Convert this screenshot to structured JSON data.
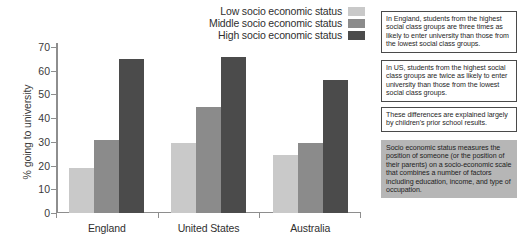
{
  "chart_data": {
    "type": "bar",
    "title": "",
    "xlabel": "",
    "ylabel": "% going to university",
    "ylim": [
      0,
      70
    ],
    "ytick_step": 10,
    "yticks": [
      "70",
      "60",
      "50",
      "40",
      "30",
      "20",
      "10",
      "0"
    ],
    "grid": false,
    "legend_position": "top-right",
    "categories": [
      "England",
      "United States",
      "Australia"
    ],
    "series": [
      {
        "name": "Low socio economic status",
        "color": "#c9c9c9",
        "values": [
          19,
          29.5,
          24.5
        ]
      },
      {
        "name": "Middle socio economic status",
        "color": "#8b8b8b",
        "values": [
          31,
          44.5,
          29.5
        ]
      },
      {
        "name": "High socio economic status",
        "color": "#4b4b4b",
        "values": [
          65,
          66,
          56
        ]
      }
    ]
  },
  "legend": {
    "items": [
      {
        "label": "Low socio economic status",
        "color": "#c9c9c9"
      },
      {
        "label": "Middle socio economic status",
        "color": "#8b8b8b"
      },
      {
        "label": "High socio economic status",
        "color": "#4b4b4b"
      }
    ]
  },
  "notes": [
    {
      "text": "In England, students from the highest social class groups are three times as likely to enter university than those from the lowest social class groups.",
      "filled": false
    },
    {
      "text": "In US, students from the highest social class groups are twice as likely to enter university than those from the lowest social class groups.",
      "filled": false
    },
    {
      "text": "These differences are explained largely by children's prior school results.",
      "filled": false
    },
    {
      "text": "Socio economic status measures the position of someone (or the position of their parents) on a socio-economic scale that combines a number of factors including education, income, and type of occupation.",
      "filled": true
    }
  ]
}
